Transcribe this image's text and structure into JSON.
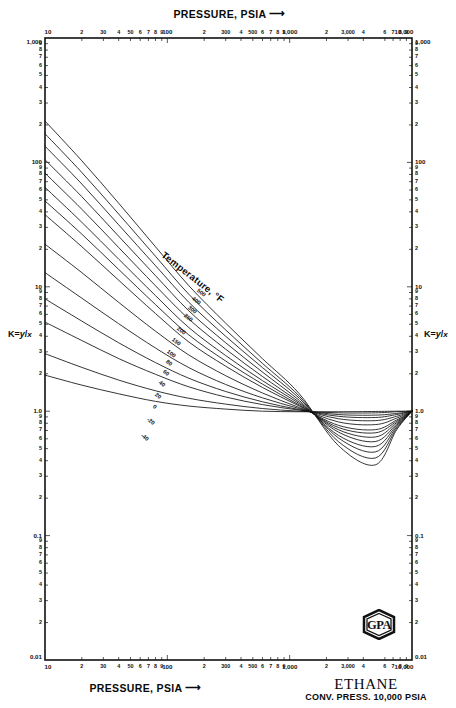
{
  "titles": {
    "top_axis": "PRESSURE, PSIA",
    "bottom_axis": "PRESSURE, PSIA",
    "arrow": "⟶",
    "species": "ETHANE",
    "conv_press": "CONV. PRESS. 10,000 PSIA",
    "y_axis_left": "K = y/x",
    "y_axis_right": "K = y/x",
    "y_axis_symbol": "K",
    "y_axis_eq": "=",
    "y_axis_num": "y",
    "y_axis_slash": "/",
    "y_axis_den": "x",
    "temperature_legend": "Temperature, °F",
    "logo": "GPA"
  },
  "axes": {
    "x_min": 10,
    "x_max": 10000,
    "y_min": 0.01,
    "y_max": 1000,
    "x_scale": "log",
    "y_scale": "log",
    "x_major_labels": [
      "10",
      "100",
      "1,000",
      "10,000"
    ],
    "y_major_labels": [
      "0.01",
      "0.1",
      "1.0",
      "10",
      "100",
      "1,000"
    ],
    "x_ticks": [
      {
        "v": 10,
        "label": "10",
        "major": true
      },
      {
        "v": 20,
        "label": "2",
        "major": false
      },
      {
        "v": 30,
        "label": "30",
        "major": false
      },
      {
        "v": 40,
        "label": "4",
        "major": false
      },
      {
        "v": 50,
        "label": "50",
        "major": false
      },
      {
        "v": 60,
        "label": "6",
        "major": false
      },
      {
        "v": 70,
        "label": "7",
        "major": false
      },
      {
        "v": 80,
        "label": "8",
        "major": false
      },
      {
        "v": 90,
        "label": "9",
        "major": false
      },
      {
        "v": 100,
        "label": "100",
        "major": true
      },
      {
        "v": 200,
        "label": "2",
        "major": false
      },
      {
        "v": 300,
        "label": "300",
        "major": false
      },
      {
        "v": 400,
        "label": "4",
        "major": false
      },
      {
        "v": 500,
        "label": "500",
        "major": false
      },
      {
        "v": 600,
        "label": "6",
        "major": false
      },
      {
        "v": 700,
        "label": "7",
        "major": false
      },
      {
        "v": 800,
        "label": "8",
        "major": false
      },
      {
        "v": 900,
        "label": "9",
        "major": false
      },
      {
        "v": 1000,
        "label": "1,000",
        "major": true
      },
      {
        "v": 2000,
        "label": "2",
        "major": false
      },
      {
        "v": 3000,
        "label": "3,000",
        "major": false
      },
      {
        "v": 4000,
        "label": "4",
        "major": false
      },
      {
        "v": 6000,
        "label": "6",
        "major": false
      },
      {
        "v": 7000,
        "label": "7",
        "major": false
      },
      {
        "v": 8000,
        "label": "8",
        "major": false
      },
      {
        "v": 9000,
        "label": "9",
        "major": false
      },
      {
        "v": 10000,
        "label": "10,000",
        "major": true
      }
    ],
    "y_ticks": [
      {
        "v": 1000,
        "label": "1,000",
        "major": true
      },
      {
        "v": 900,
        "label": "9",
        "major": false
      },
      {
        "v": 800,
        "label": "8",
        "major": false
      },
      {
        "v": 700,
        "label": "7",
        "major": false
      },
      {
        "v": 600,
        "label": "6",
        "major": false
      },
      {
        "v": 500,
        "label": "5",
        "major": false
      },
      {
        "v": 400,
        "label": "4",
        "major": false
      },
      {
        "v": 300,
        "label": "3",
        "major": false
      },
      {
        "v": 200,
        "label": "2",
        "major": false
      },
      {
        "v": 100,
        "label": "100",
        "major": true
      },
      {
        "v": 90,
        "label": "9",
        "major": false
      },
      {
        "v": 80,
        "label": "8",
        "major": false
      },
      {
        "v": 70,
        "label": "7",
        "major": false
      },
      {
        "v": 60,
        "label": "6",
        "major": false
      },
      {
        "v": 50,
        "label": "5",
        "major": false
      },
      {
        "v": 40,
        "label": "4",
        "major": false
      },
      {
        "v": 30,
        "label": "3",
        "major": false
      },
      {
        "v": 20,
        "label": "2",
        "major": false
      },
      {
        "v": 10,
        "label": "10",
        "major": true
      },
      {
        "v": 9,
        "label": "9",
        "major": false
      },
      {
        "v": 8,
        "label": "8",
        "major": false
      },
      {
        "v": 7,
        "label": "7",
        "major": false
      },
      {
        "v": 6,
        "label": "6",
        "major": false
      },
      {
        "v": 5,
        "label": "5",
        "major": false
      },
      {
        "v": 4,
        "label": "4",
        "major": false
      },
      {
        "v": 3,
        "label": "3",
        "major": false
      },
      {
        "v": 2,
        "label": "2",
        "major": false
      },
      {
        "v": 1,
        "label": "1.0",
        "major": true
      },
      {
        "v": 0.9,
        "label": "9",
        "major": false
      },
      {
        "v": 0.8,
        "label": "8",
        "major": false
      },
      {
        "v": 0.7,
        "label": "7",
        "major": false
      },
      {
        "v": 0.6,
        "label": "6",
        "major": false
      },
      {
        "v": 0.5,
        "label": "5",
        "major": false
      },
      {
        "v": 0.4,
        "label": "4",
        "major": false
      },
      {
        "v": 0.3,
        "label": "3",
        "major": false
      },
      {
        "v": 0.2,
        "label": "2",
        "major": false
      },
      {
        "v": 0.1,
        "label": "0.1",
        "major": true
      },
      {
        "v": 0.09,
        "label": "9",
        "major": false
      },
      {
        "v": 0.08,
        "label": "8",
        "major": false
      },
      {
        "v": 0.07,
        "label": "7",
        "major": false
      },
      {
        "v": 0.06,
        "label": "6",
        "major": false
      },
      {
        "v": 0.05,
        "label": "5",
        "major": false
      },
      {
        "v": 0.04,
        "label": "4",
        "major": false
      },
      {
        "v": 0.03,
        "label": "3",
        "major": false
      },
      {
        "v": 0.02,
        "label": "2",
        "major": false
      },
      {
        "v": 0.01,
        "label": "0.01",
        "major": true
      }
    ]
  },
  "chart_data": {
    "type": "line",
    "title": "ETHANE",
    "subtitle": "CONV. PRESS. 10,000 PSIA",
    "xlabel": "PRESSURE, PSIA",
    "ylabel": "K = y/x",
    "xscale": "log",
    "yscale": "log",
    "xlim": [
      10,
      10000
    ],
    "ylim": [
      0.01,
      1000
    ],
    "grid": false,
    "legend": "inline-curve-labels",
    "legend_title": "Temperature, °F",
    "convergence_point": {
      "pressure": 10000,
      "k": 1.0
    },
    "series": [
      {
        "name": "500",
        "label": "500",
        "x": [
          10,
          20,
          40,
          80,
          150,
          300,
          600,
          1200,
          2500,
          5000,
          7500,
          10000
        ],
        "y": [
          1.95,
          1.62,
          1.38,
          1.2,
          1.1,
          1.04,
          1.0,
          0.99,
          0.99,
          0.995,
          1.0,
          1.0
        ]
      },
      {
        "name": "400",
        "label": "400",
        "x": [
          10,
          20,
          40,
          80,
          150,
          300,
          600,
          1200,
          2500,
          5000,
          7500,
          10000
        ],
        "y": [
          2.9,
          2.25,
          1.78,
          1.46,
          1.27,
          1.14,
          1.05,
          1.0,
          0.97,
          0.97,
          0.99,
          1.0
        ]
      },
      {
        "name": "300",
        "label": "300",
        "x": [
          10,
          20,
          40,
          80,
          150,
          300,
          600,
          1200,
          2500,
          5000,
          7500,
          10000
        ],
        "y": [
          5.2,
          3.7,
          2.65,
          1.98,
          1.57,
          1.3,
          1.13,
          1.02,
          0.94,
          0.93,
          0.96,
          1.0
        ]
      },
      {
        "name": "250",
        "label": "250",
        "x": [
          10,
          20,
          40,
          80,
          150,
          300,
          600,
          1200,
          2500,
          5000,
          7500,
          10000
        ],
        "y": [
          8.0,
          5.3,
          3.55,
          2.46,
          1.84,
          1.44,
          1.19,
          1.03,
          0.91,
          0.89,
          0.94,
          1.0
        ]
      },
      {
        "name": "200",
        "label": "200",
        "x": [
          10,
          20,
          40,
          80,
          150,
          300,
          600,
          1200,
          2500,
          5000,
          7500,
          10000
        ],
        "y": [
          13.0,
          8.1,
          5.05,
          3.22,
          2.24,
          1.64,
          1.28,
          1.05,
          0.87,
          0.84,
          0.91,
          1.0
        ]
      },
      {
        "name": "150",
        "label": "150",
        "x": [
          10,
          20,
          40,
          80,
          150,
          300,
          600,
          1200,
          2500,
          5000,
          7500,
          10000
        ],
        "y": [
          22.0,
          13.0,
          7.5,
          4.4,
          2.83,
          1.93,
          1.4,
          1.07,
          0.82,
          0.78,
          0.88,
          1.0
        ]
      },
      {
        "name": "100",
        "label": "100",
        "x": [
          10,
          20,
          40,
          80,
          150,
          300,
          600,
          1200,
          2500,
          5000,
          7500,
          10000
        ],
        "y": [
          38.0,
          21.0,
          11.3,
          6.1,
          3.6,
          2.3,
          1.55,
          1.1,
          0.77,
          0.71,
          0.85,
          1.0
        ]
      },
      {
        "name": "80",
        "label": "80",
        "x": [
          10,
          20,
          40,
          80,
          150,
          300,
          600,
          1200,
          2500,
          5000,
          7500,
          10000
        ],
        "y": [
          49.0,
          26.5,
          13.8,
          7.2,
          4.1,
          2.53,
          1.65,
          1.12,
          0.74,
          0.67,
          0.83,
          1.0
        ]
      },
      {
        "name": "60",
        "label": "60",
        "x": [
          10,
          20,
          40,
          80,
          150,
          300,
          600,
          1200,
          2500,
          5000,
          7500,
          10000
        ],
        "y": [
          63.0,
          33.0,
          16.7,
          8.5,
          4.7,
          2.8,
          1.76,
          1.15,
          0.71,
          0.62,
          0.81,
          1.0
        ]
      },
      {
        "name": "40",
        "label": "40",
        "x": [
          10,
          20,
          40,
          80,
          150,
          300,
          600,
          1200,
          2500,
          5000,
          7500,
          10000
        ],
        "y": [
          82.0,
          42.0,
          20.7,
          10.2,
          5.5,
          3.15,
          1.9,
          1.18,
          0.68,
          0.57,
          0.79,
          1.0
        ]
      },
      {
        "name": "20",
        "label": "20",
        "x": [
          10,
          20,
          40,
          80,
          150,
          300,
          600,
          1200,
          2500,
          5000,
          7500,
          10000
        ],
        "y": [
          105.0,
          53.0,
          25.5,
          12.3,
          6.4,
          3.55,
          2.06,
          1.22,
          0.64,
          0.52,
          0.77,
          1.0
        ]
      },
      {
        "name": "0",
        "label": "0",
        "x": [
          10,
          20,
          40,
          80,
          150,
          300,
          600,
          1200,
          2500,
          5000,
          7500,
          10000
        ],
        "y": [
          135.0,
          67.0,
          31.5,
          14.8,
          7.5,
          4.0,
          2.24,
          1.27,
          0.61,
          0.47,
          0.75,
          1.0
        ]
      },
      {
        "name": "-20",
        "label": "-20",
        "x": [
          10,
          20,
          40,
          80,
          150,
          300,
          600,
          1200,
          2500,
          5000,
          7500,
          10000
        ],
        "y": [
          170.0,
          83.0,
          38.5,
          17.6,
          8.7,
          4.5,
          2.42,
          1.32,
          0.57,
          0.42,
          0.73,
          1.0
        ]
      },
      {
        "name": "-40",
        "label": "-40",
        "x": [
          10,
          20,
          40,
          80,
          150,
          300,
          600,
          1200,
          2500,
          5000,
          7500,
          10000
        ],
        "y": [
          215.0,
          103.0,
          47.0,
          21.0,
          10.2,
          5.1,
          2.64,
          1.38,
          0.53,
          0.37,
          0.71,
          1.0
        ]
      }
    ]
  },
  "curve_labels": [
    {
      "text": "500",
      "x": 196,
      "y": 289,
      "rot": 38
    },
    {
      "text": "400",
      "x": 191,
      "y": 297,
      "rot": 38
    },
    {
      "text": "300",
      "x": 187,
      "y": 306,
      "rot": 38
    },
    {
      "text": "250",
      "x": 183,
      "y": 314,
      "rot": 38
    },
    {
      "text": "200",
      "x": 176,
      "y": 327,
      "rot": 38
    },
    {
      "text": "150",
      "x": 171,
      "y": 338,
      "rot": 38
    },
    {
      "text": "100",
      "x": 166,
      "y": 350,
      "rot": 38
    },
    {
      "text": "80",
      "x": 165,
      "y": 360,
      "rot": 38
    },
    {
      "text": "60",
      "x": 162,
      "y": 370,
      "rot": 38
    },
    {
      "text": "40",
      "x": 158,
      "y": 381,
      "rot": 38
    },
    {
      "text": "20",
      "x": 154,
      "y": 393,
      "rot": 38
    },
    {
      "text": "0",
      "x": 152,
      "y": 405,
      "rot": 38
    },
    {
      "text": "-20",
      "x": 146,
      "y": 418,
      "rot": 38
    },
    {
      "text": "-40",
      "x": 140,
      "y": 434,
      "rot": 38
    }
  ]
}
